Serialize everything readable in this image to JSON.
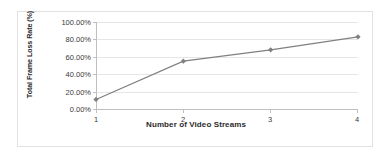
{
  "chart_data": {
    "type": "line",
    "title": "",
    "xlabel": "Number of Video Streams",
    "ylabel": "Total Frame Loss Rate (%)",
    "categories": [
      "1",
      "2",
      "3",
      "4"
    ],
    "x": [
      1,
      2,
      3,
      4
    ],
    "values": [
      0.11,
      0.55,
      0.68,
      0.83
    ],
    "value_labels": [
      "11.00%",
      "55.00%",
      "68.00%",
      "83.00%"
    ],
    "ylim": [
      0,
      1
    ],
    "xlim": [
      1,
      4
    ],
    "y_ticks": [
      0,
      0.2,
      0.4,
      0.6,
      0.8,
      1.0
    ],
    "y_tick_labels": [
      "0.00%",
      "20.00%",
      "40.00%",
      "60.00%",
      "80.00%",
      "100.00%"
    ],
    "x_tick_labels": [
      "1",
      "2",
      "3",
      "4"
    ],
    "grid": true,
    "grid_axis": "y",
    "legend": false,
    "legend_position": "none",
    "series": [
      {
        "name": "Total Frame Loss Rate",
        "values": [
          0.11,
          0.55,
          0.68,
          0.83
        ],
        "color": "#808080",
        "marker": "diamond",
        "line_width": 1.2
      }
    ],
    "colors": {
      "series": "#808080",
      "gridline": "#e6e6e6",
      "axis": "#bfbfbf",
      "text": "#3a3a3a",
      "title_text": "#2b2b2b",
      "background": "#ffffff",
      "frame_border": "#e2e2e2"
    }
  }
}
